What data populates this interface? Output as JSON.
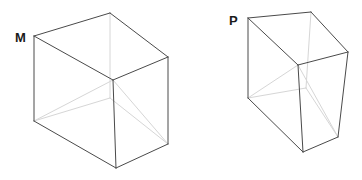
{
  "figure": {
    "background_color": "#ffffff",
    "width": 362,
    "height": 180,
    "stroke_visible_color": "#4a4a4a",
    "stroke_hidden_color": "#d6d6d6",
    "stroke_visible_width": 1,
    "stroke_hidden_width": 1,
    "label_color": "#1a1a1a"
  },
  "shapes": [
    {
      "id": "shape-m",
      "label": "M",
      "label_position": {
        "x": 15,
        "y": 42
      },
      "description": "Wireframe cube, open-top isometric view, labelled M at its upper-left vertex",
      "vertices": {
        "top_left": {
          "x": 34,
          "y": 36
        },
        "top_back": {
          "x": 110,
          "y": 13
        },
        "top_right": {
          "x": 168,
          "y": 57
        },
        "top_front": {
          "x": 113,
          "y": 80
        },
        "bottom_left": {
          "x": 34,
          "y": 121
        },
        "bottom_back": {
          "x": 110,
          "y": 98
        },
        "bottom_right": {
          "x": 168,
          "y": 144
        },
        "bottom_front": {
          "x": 116,
          "y": 168
        }
      },
      "edges_visible": [
        "top_left,top_back",
        "top_back,top_right",
        "top_right,top_front",
        "top_front,top_left",
        "top_left,bottom_left",
        "top_right,bottom_right",
        "top_front,bottom_front",
        "bottom_left,bottom_front",
        "bottom_front,bottom_right"
      ],
      "edges_hidden": [
        "top_back,bottom_back",
        "bottom_back,bottom_left",
        "bottom_back,bottom_right",
        "top_front,bottom_left",
        "top_front,bottom_right"
      ]
    },
    {
      "id": "shape-p",
      "label": "P",
      "label_position": {
        "x": 229,
        "y": 25
      },
      "description": "Wireframe rectangular box, narrower and taller than M, labelled P at its upper-left vertex",
      "vertices": {
        "top_left": {
          "x": 248,
          "y": 18
        },
        "top_back": {
          "x": 311,
          "y": 12
        },
        "top_right": {
          "x": 348,
          "y": 52
        },
        "top_front": {
          "x": 298,
          "y": 65
        },
        "bottom_left": {
          "x": 248,
          "y": 98
        },
        "bottom_back": {
          "x": 306,
          "y": 88
        },
        "bottom_right": {
          "x": 338,
          "y": 137
        },
        "bottom_front": {
          "x": 303,
          "y": 152
        }
      },
      "edges_visible": [
        "top_left,top_back",
        "top_back,top_right",
        "top_right,top_front",
        "top_front,top_left",
        "top_left,bottom_left",
        "top_right,bottom_right",
        "top_front,bottom_front",
        "bottom_left,bottom_front",
        "bottom_front,bottom_right"
      ],
      "edges_hidden": [
        "top_back,bottom_back",
        "bottom_back,bottom_left",
        "bottom_back,bottom_right",
        "top_front,bottom_left",
        "top_front,bottom_right"
      ]
    }
  ]
}
